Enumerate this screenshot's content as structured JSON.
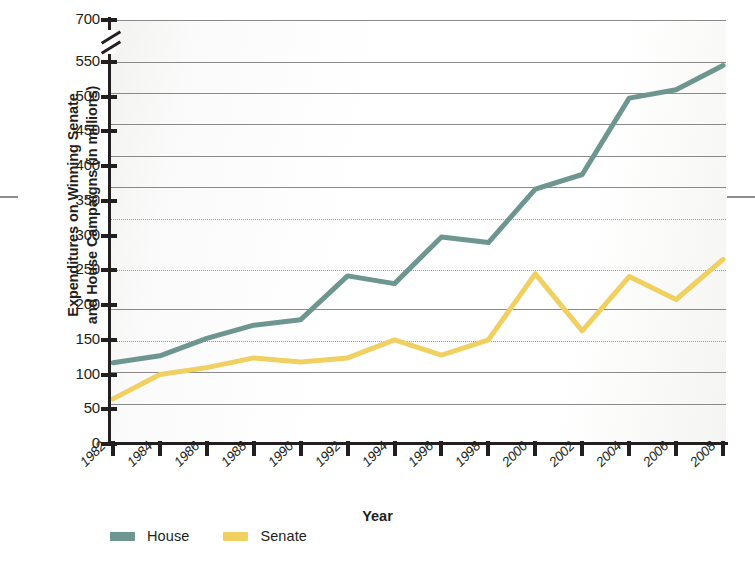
{
  "chart_data": {
    "type": "line",
    "title": "",
    "xlabel": "Year",
    "ylabel": "Expenditures on Winning Senate\nand House Campaigns (in millions)",
    "x": [
      1982,
      1984,
      1986,
      1988,
      1990,
      1992,
      1994,
      1996,
      1998,
      2000,
      2002,
      2004,
      2006,
      2008
    ],
    "categories": [
      "1982",
      "1984",
      "1986",
      "1988",
      "1990",
      "1992",
      "1994",
      "1996",
      "1998",
      "2000",
      "2002",
      "2004",
      "2006",
      "2008"
    ],
    "series": [
      {
        "name": "House",
        "color": "#6d9690",
        "values": [
          117,
          127,
          152,
          171,
          179,
          242,
          231,
          298,
          290,
          367,
          388,
          498,
          510,
          545
        ]
      },
      {
        "name": "Senate",
        "color": "#f0d060",
        "values": [
          65,
          100,
          110,
          124,
          118,
          124,
          150,
          128,
          150,
          245,
          163,
          241,
          208,
          266
        ]
      }
    ],
    "yticks": [
      0,
      50,
      100,
      150,
      200,
      250,
      300,
      350,
      400,
      450,
      500,
      550,
      700
    ],
    "ytick_labels": [
      "0",
      "50",
      "100",
      "150",
      "200",
      "250",
      "300",
      "350",
      "400",
      "450",
      "500",
      "550",
      "700"
    ],
    "ylim": [
      0,
      700
    ],
    "axis_break": {
      "between": [
        550,
        700
      ],
      "present": true
    },
    "grid": true,
    "legend_position": "bottom-left",
    "legend": [
      "House",
      "Senate"
    ]
  },
  "axis": {
    "x_title": "Year",
    "y_title": "Expenditures on Winning Senate\nand House Campaigns (in millions)"
  }
}
